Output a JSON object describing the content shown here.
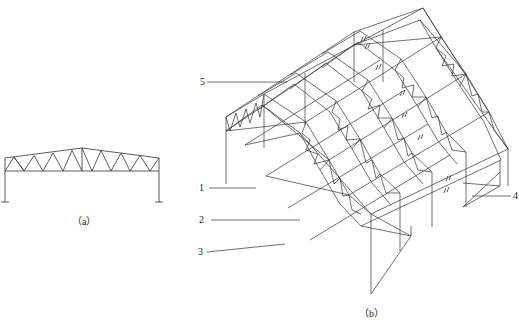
{
  "figure": {
    "panel_a": {
      "caption": "（a）",
      "description": "2D portal frame with roof truss"
    },
    "panel_b": {
      "caption": "（b）",
      "description": "3D isometric view of steel truss roof structure with bracing"
    },
    "callouts": [
      {
        "id": "1",
        "label": "1"
      },
      {
        "id": "2",
        "label": "2"
      },
      {
        "id": "3",
        "label": "3"
      },
      {
        "id": "4",
        "label": "4"
      },
      {
        "id": "5",
        "label": "5"
      }
    ],
    "line_color": "#333333",
    "background": "#ffffff"
  }
}
